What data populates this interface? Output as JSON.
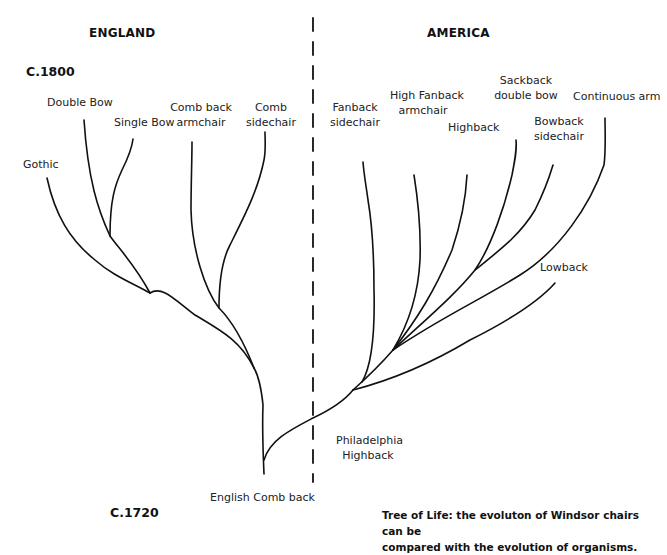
{
  "headers": {
    "left": "ENGLAND",
    "right": "AMERICA"
  },
  "eras": {
    "top": "C.1800",
    "bottom": "C.1720"
  },
  "england": {
    "leaves": [
      {
        "line1": "Double Bow",
        "line2": ""
      },
      {
        "line1": "Single Bow",
        "line2": ""
      },
      {
        "line1": "Comb back",
        "line2": "armchair"
      },
      {
        "line1": "Comb",
        "line2": "sidechair"
      },
      {
        "line1": "Gothic",
        "line2": ""
      }
    ],
    "root": "English Comb back"
  },
  "america": {
    "leaves": [
      {
        "line1": "Fanback",
        "line2": "sidechair"
      },
      {
        "line1": "High Fanback",
        "line2": "armchair"
      },
      {
        "line1": "Highback",
        "line2": ""
      },
      {
        "line1": "Sackback",
        "line2": "double bow"
      },
      {
        "line1": "Continuous arm",
        "line2": ""
      },
      {
        "line1": "Bowback",
        "line2": "sidechair"
      },
      {
        "line1": "Lowback",
        "line2": ""
      }
    ],
    "root": {
      "line1": "Philadelphia",
      "line2": "Highback"
    }
  },
  "caption": {
    "line1": "Tree of Life: the evoluton of Windsor chairs can be",
    "line2": "compared with the evolution of organisms."
  },
  "colors": {
    "line": "#111111",
    "background": "#ffffff"
  }
}
